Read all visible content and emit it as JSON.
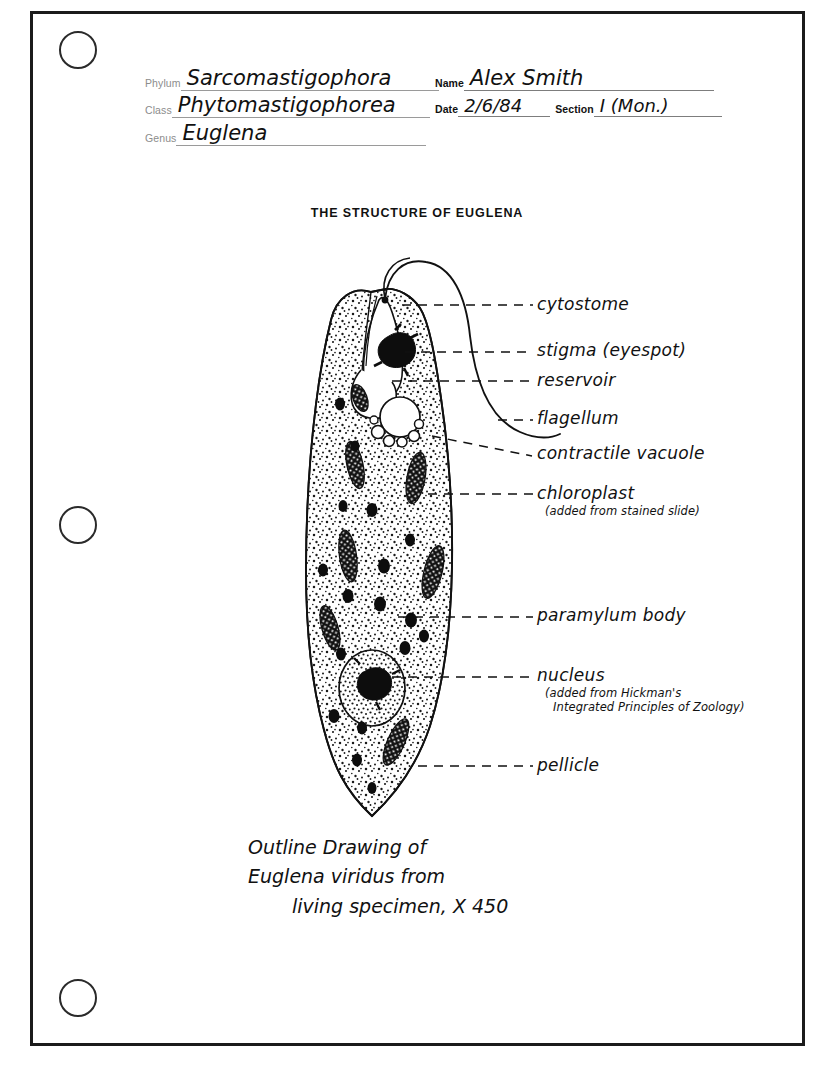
{
  "page": {
    "punch_holes": [
      "punch-hole-top",
      "punch-hole-middle",
      "punch-hole-bottom"
    ],
    "border_color": "#1b1b1b"
  },
  "header": {
    "phylum": {
      "label": "Phylum",
      "value": "Sarcomastigophora"
    },
    "class": {
      "label": "Class",
      "value": "Phytomastigophorea"
    },
    "genus": {
      "label": "Genus",
      "value": "Euglena"
    },
    "name": {
      "label": "Name",
      "value": "Alex Smith"
    },
    "date": {
      "label": "Date",
      "value": "2/6/84"
    },
    "section": {
      "label": "Section",
      "value": "I (Mon.)"
    }
  },
  "title": "THE STRUCTURE OF EUGLENA",
  "labels": [
    {
      "name": "cytostome",
      "text": "cytostome",
      "sub": ""
    },
    {
      "name": "stigma",
      "text": "stigma (eyespot)",
      "sub": ""
    },
    {
      "name": "reservoir",
      "text": "reservoir",
      "sub": ""
    },
    {
      "name": "flagellum",
      "text": "flagellum",
      "sub": ""
    },
    {
      "name": "contractile-vacuole",
      "text": "contractile vacuole",
      "sub": ""
    },
    {
      "name": "chloroplast",
      "text": "chloroplast",
      "sub": "(added from stained slide)"
    },
    {
      "name": "paramylum-body",
      "text": "paramylum body",
      "sub": ""
    },
    {
      "name": "nucleus",
      "text": "nucleus",
      "sub_line1": "(added from Hickman's",
      "sub_line2": "Integrated Principles of Zoology)"
    },
    {
      "name": "pellicle",
      "text": "pellicle",
      "sub": ""
    }
  ],
  "caption": {
    "line1": "Outline Drawing of",
    "line2": "Euglena viridus from",
    "line3": "living specimen, X 450"
  },
  "colors": {
    "ink": "#111111",
    "form_label_gray": "#8c8c8c",
    "rule_line": "#9a9a9a",
    "paper": "#ffffff"
  }
}
